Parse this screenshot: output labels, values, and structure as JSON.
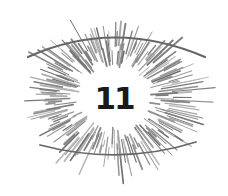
{
  "illustration": {
    "label": "11",
    "description": "eye-burst",
    "colors": {
      "background": "#ffffff",
      "rays": "#8a8a8a",
      "eyelids": "#666666",
      "number": "#1a1a1a"
    },
    "center": [
      114,
      97
    ],
    "inner_radius": 30,
    "outer_radius_x": 105,
    "outer_radius_y": 88,
    "ray_count": 220,
    "upper_lid": {
      "start": [
        28,
        57
      ],
      "control": [
        114,
        18
      ],
      "end": [
        205,
        57
      ]
    },
    "lower_lid": {
      "start": [
        40,
        145
      ],
      "control": [
        120,
        166
      ],
      "end": [
        196,
        142
      ]
    }
  }
}
